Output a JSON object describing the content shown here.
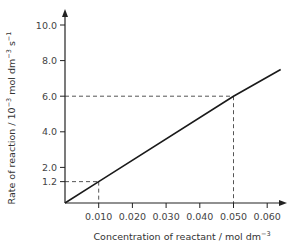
{
  "chart_data": {
    "type": "line",
    "title": "",
    "xlabel": "Concentration of reactant / mol dm⁻³",
    "ylabel": "Rate of reaction / 10⁻³ mol dm⁻³ s⁻¹",
    "xlabel_parts": {
      "main": "Concentration of reactant / mol dm",
      "sup": "−3"
    },
    "ylabel_parts": {
      "main": "Rate of reaction / 10",
      "sup1": "−3",
      "mid": " mol dm",
      "sup2": "−3",
      "mid2": " s",
      "sup3": "−1"
    },
    "xlim": [
      0,
      0.065
    ],
    "ylim": [
      0,
      10.8
    ],
    "x_ticks": [
      "0.010",
      "0.020",
      "0.030",
      "0.040",
      "0.050",
      "0.060"
    ],
    "x_tick_values": [
      0.01,
      0.02,
      0.03,
      0.04,
      0.05,
      0.06
    ],
    "y_ticks": [
      "1.2",
      "2.0",
      "4.0",
      "6.0",
      "8.0",
      "10.0"
    ],
    "y_tick_values": [
      1.2,
      2.0,
      4.0,
      6.0,
      8.0,
      10.0
    ],
    "grid": false,
    "legend": null,
    "series": [
      {
        "name": "rate",
        "x": [
          0,
          0.01,
          0.05,
          0.064
        ],
        "y": [
          0,
          1.2,
          6.0,
          7.5
        ]
      }
    ],
    "annotations": [
      {
        "type": "dashed-guide",
        "x": 0.01,
        "y": 1.2
      },
      {
        "type": "dashed-guide",
        "x": 0.05,
        "y": 6.0
      }
    ]
  }
}
